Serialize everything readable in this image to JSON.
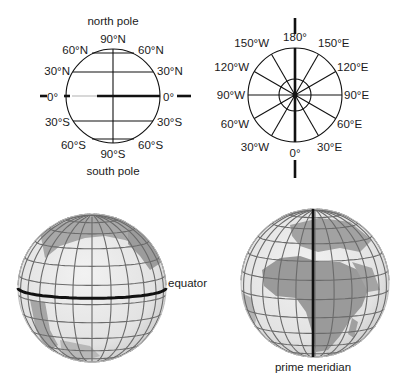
{
  "latitude_diagram": {
    "top_label": "north pole",
    "bottom_label": "south pole",
    "north_90": "90°N",
    "north_60_left": "60°N",
    "north_60_right": "60°N",
    "north_30_left": "30°N",
    "north_30_right": "30°N",
    "equator_left": "0°",
    "equator_right": "0°",
    "south_30_left": "30°S",
    "south_30_right": "30°S",
    "south_60_left": "60°S",
    "south_60_right": "60°S",
    "south_90": "90°S"
  },
  "longitude_diagram": {
    "top": "180°",
    "bottom": "0°",
    "w150": "150°W",
    "e150": "150°E",
    "w120": "120°W",
    "e120": "120°E",
    "w90": "90°W",
    "e90": "90°E",
    "w60": "60°W",
    "e60": "60°E",
    "w30": "30°W",
    "e30": "30°E"
  },
  "globes": {
    "equator_label": "equator",
    "prime_meridian_label": "prime meridian"
  },
  "colors": {
    "land": "#9a9a9a",
    "ocean": "#e4e4e4",
    "grid": "#6b6b6b",
    "highlight": "#111111"
  }
}
